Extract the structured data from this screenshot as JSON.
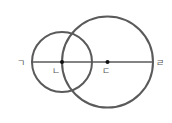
{
  "diagram": {
    "stroke_color": "#5a5a5a",
    "point_color": "#111111",
    "line": {
      "x1": 31,
      "y1": 62,
      "x2": 153,
      "y2": 62
    },
    "small_circle": {
      "cx": 62,
      "cy": 62,
      "r": 30
    },
    "large_circle": {
      "cx": 107.5,
      "cy": 62,
      "r": 45.5
    },
    "points": [
      {
        "id": "n",
        "cx": 62,
        "cy": 62
      },
      {
        "id": "d",
        "cx": 107.5,
        "cy": 62
      }
    ],
    "labels": {
      "g": "ㄱ",
      "n": "ㄴ",
      "d": "ㄷ",
      "r": "ㄹ"
    }
  }
}
